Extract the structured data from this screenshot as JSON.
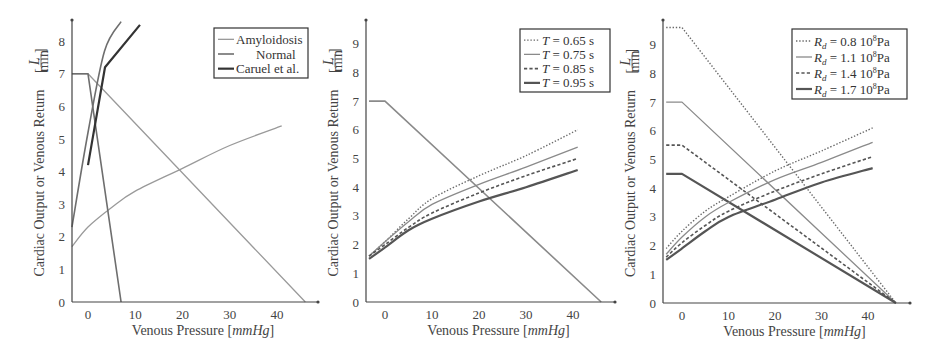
{
  "chart_data": [
    {
      "type": "line",
      "title": "",
      "xlabel": "Venous Pressure [mmHg]",
      "ylabel": "Cardiac Output or Venous Return [L/min]",
      "xlim": [
        -3.4,
        49
      ],
      "ylim": [
        0,
        8.6
      ],
      "xticks": [
        "0",
        "10",
        "20",
        "30",
        "40"
      ],
      "yticks": [
        "0",
        "1",
        "2",
        "3",
        "4",
        "5",
        "6",
        "7",
        "8"
      ],
      "grid": false,
      "legend_position": "upper right",
      "legend": [
        "Amyloidosis",
        "Normal",
        "Caruel et al."
      ],
      "series": [
        {
          "name": "Amyloidosis",
          "kind": "venous_return",
          "style": "solid-light",
          "color": "#9a9a9a",
          "x": [
            -3.4,
            0,
            46
          ],
          "y": [
            7.0,
            7.0,
            0
          ]
        },
        {
          "name": "Amyloidosis",
          "kind": "cardiac_output",
          "style": "solid-light",
          "color": "#9a9a9a",
          "x": [
            -3.4,
            0,
            5,
            10,
            20,
            30,
            41
          ],
          "y": [
            1.7,
            2.3,
            2.9,
            3.4,
            4.1,
            4.8,
            5.4
          ]
        },
        {
          "name": "Normal",
          "kind": "venous_return",
          "style": "solid-mid",
          "color": "#6e6e6e",
          "x": [
            -3.4,
            0,
            7
          ],
          "y": [
            7.0,
            7.0,
            0
          ]
        },
        {
          "name": "Normal",
          "kind": "cardiac_output",
          "style": "solid-mid",
          "color": "#6e6e6e",
          "x": [
            -3.4,
            0,
            3.5,
            7
          ],
          "y": [
            2.3,
            5.2,
            7.7,
            8.6
          ]
        },
        {
          "name": "Caruel et al.",
          "kind": "cardiac_output",
          "style": "solid-dark",
          "color": "#333333",
          "x": [
            0,
            3.6,
            11
          ],
          "y": [
            4.2,
            7.2,
            8.5
          ]
        }
      ]
    },
    {
      "type": "line",
      "title": "",
      "xlabel": "Venous Pressure [mmHg]",
      "ylabel": "Cardiac Output or Venous Return [L/min]",
      "xlim": [
        -3.4,
        49
      ],
      "ylim": [
        0,
        9.8
      ],
      "xticks": [
        "0",
        "10",
        "20",
        "30",
        "40"
      ],
      "yticks": [
        "0",
        "1",
        "2",
        "3",
        "4",
        "5",
        "6",
        "7",
        "8",
        "9"
      ],
      "grid": false,
      "legend_position": "upper right",
      "legend": [
        "T = 0.65 s",
        "T = 0.75 s",
        "T = 0.85 s",
        "T = 0.95 s"
      ],
      "series": [
        {
          "name": "Venous Return",
          "kind": "venous_return",
          "style": "solid-mid",
          "color": "#8a8a8a",
          "x": [
            -3.4,
            0,
            46
          ],
          "y": [
            7.0,
            7.0,
            0
          ]
        },
        {
          "name": "T = 0.65 s",
          "kind": "cardiac_output",
          "style": "dotted",
          "color": "#6a6a6a",
          "x": [
            -3.4,
            0,
            5,
            10,
            20,
            30,
            41
          ],
          "y": [
            1.6,
            2.1,
            2.9,
            3.6,
            4.4,
            5.1,
            6.0
          ]
        },
        {
          "name": "T = 0.75 s",
          "kind": "cardiac_output",
          "style": "solid-light",
          "color": "#8a8a8a",
          "x": [
            -3.4,
            0,
            5,
            10,
            20,
            30,
            41
          ],
          "y": [
            1.6,
            2.1,
            2.8,
            3.4,
            4.1,
            4.7,
            5.4
          ]
        },
        {
          "name": "T = 0.85 s",
          "kind": "cardiac_output",
          "style": "dashed",
          "color": "#555555",
          "x": [
            -3.4,
            0,
            5,
            10,
            20,
            30,
            41
          ],
          "y": [
            1.6,
            2.0,
            2.6,
            3.1,
            3.8,
            4.4,
            5.0
          ]
        },
        {
          "name": "T = 0.95 s",
          "kind": "cardiac_output",
          "style": "solid-dark",
          "color": "#555555",
          "x": [
            -3.4,
            0,
            5,
            10,
            20,
            30,
            41
          ],
          "y": [
            1.5,
            1.9,
            2.5,
            2.9,
            3.5,
            4.0,
            4.6
          ]
        }
      ]
    },
    {
      "type": "line",
      "title": "",
      "xlabel": "Venous Pressure [mmHg]",
      "ylabel": "Cardiac Output or Venous Return [L/min]",
      "xlim": [
        -3.4,
        49
      ],
      "ylim": [
        0,
        9.8
      ],
      "xticks": [
        "0",
        "10",
        "20",
        "30",
        "40"
      ],
      "yticks": [
        "0",
        "1",
        "2",
        "3",
        "4",
        "5",
        "6",
        "7",
        "8",
        "9"
      ],
      "grid": false,
      "legend_position": "upper right",
      "legend": [
        "R_d = 0.8 10^8 Pa",
        "R_d = 1.1 10^8 Pa",
        "R_d = 1.4 10^8 Pa",
        "R_d = 1.7 10^8 Pa"
      ],
      "series": [
        {
          "name": "R_d = 0.8 10^8 Pa",
          "kind": "venous_return",
          "style": "dotted",
          "color": "#6a6a6a",
          "x": [
            -3.4,
            0,
            46
          ],
          "y": [
            9.6,
            9.6,
            0
          ]
        },
        {
          "name": "R_d = 1.1 10^8 Pa",
          "kind": "venous_return",
          "style": "solid-light",
          "color": "#8a8a8a",
          "x": [
            -3.4,
            0,
            46
          ],
          "y": [
            7.0,
            7.0,
            0
          ]
        },
        {
          "name": "R_d = 1.4 10^8 Pa",
          "kind": "venous_return",
          "style": "dashed",
          "color": "#555555",
          "x": [
            -3.4,
            0,
            46
          ],
          "y": [
            5.5,
            5.5,
            0
          ]
        },
        {
          "name": "R_d = 1.7 10^8 Pa",
          "kind": "venous_return",
          "style": "solid-dark",
          "color": "#555555",
          "x": [
            -3.4,
            0,
            46
          ],
          "y": [
            4.5,
            4.5,
            0
          ]
        },
        {
          "name": "R_d = 0.8 10^8 Pa",
          "kind": "cardiac_output",
          "style": "dotted",
          "color": "#6a6a6a",
          "x": [
            -3.4,
            0,
            5,
            10,
            20,
            30,
            41
          ],
          "y": [
            1.9,
            2.5,
            3.2,
            3.7,
            4.6,
            5.3,
            6.1
          ]
        },
        {
          "name": "R_d = 1.1 10^8 Pa",
          "kind": "cardiac_output",
          "style": "solid-light",
          "color": "#8a8a8a",
          "x": [
            -3.4,
            0,
            5,
            10,
            20,
            30,
            41
          ],
          "y": [
            1.7,
            2.3,
            3.0,
            3.5,
            4.3,
            4.9,
            5.6
          ]
        },
        {
          "name": "R_d = 1.4 10^8 Pa",
          "kind": "cardiac_output",
          "style": "dashed",
          "color": "#555555",
          "x": [
            -3.4,
            0,
            5,
            10,
            20,
            30,
            41
          ],
          "y": [
            1.6,
            2.1,
            2.7,
            3.2,
            3.9,
            4.5,
            5.1
          ]
        },
        {
          "name": "R_d = 1.7 10^8 Pa",
          "kind": "cardiac_output",
          "style": "solid-dark",
          "color": "#555555",
          "x": [
            -3.4,
            0,
            5,
            10,
            20,
            30,
            41
          ],
          "y": [
            1.5,
            1.9,
            2.5,
            3.0,
            3.6,
            4.2,
            4.7
          ]
        }
      ]
    }
  ],
  "panels": [
    {
      "xlabel_main": "Venous Pressure ",
      "xlabel_unit": "[mmHg]",
      "ylabel_main": "Cardiac Output or Venous Return ",
      "ylabel_unit_num": "L",
      "ylabel_unit_den": "min",
      "legend": [
        {
          "label": "Amyloidosis"
        },
        {
          "label": "Normal"
        },
        {
          "label": "Caruel et al."
        }
      ]
    },
    {
      "xlabel_main": "Venous Pressure ",
      "xlabel_unit": "[mmHg]",
      "ylabel_main": "Cardiac Output or Venous Return ",
      "ylabel_unit_num": "L",
      "ylabel_unit_den": "min",
      "legend": [
        {
          "var": "T",
          "eq": " = 0.65 s"
        },
        {
          "var": "T",
          "eq": " = 0.75 s"
        },
        {
          "var": "T",
          "eq": " = 0.85 s"
        },
        {
          "var": "T",
          "eq": " = 0.95 s"
        }
      ]
    },
    {
      "xlabel_main": "Venous Pressure ",
      "xlabel_unit": "[mmHg]",
      "ylabel_main": "Cardiac Output or Venous Return ",
      "ylabel_unit_num": "L",
      "ylabel_unit_den": "min",
      "legend": [
        {
          "var": "R",
          "sub": "d",
          "eq": " = 0.8 10",
          "exp": "8",
          "unit": "Pa"
        },
        {
          "var": "R",
          "sub": "d",
          "eq": " = 1.1 10",
          "exp": "8",
          "unit": "Pa"
        },
        {
          "var": "R",
          "sub": "d",
          "eq": " = 1.4 10",
          "exp": "8",
          "unit": "Pa"
        },
        {
          "var": "R",
          "sub": "d",
          "eq": " = 1.7 10",
          "exp": "8",
          "unit": "Pa"
        }
      ]
    }
  ]
}
